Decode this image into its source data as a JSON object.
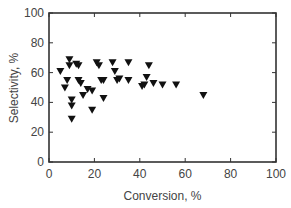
{
  "chart_data": {
    "type": "scatter",
    "title": "",
    "xlabel": "Conversion, %",
    "ylabel": "Selectivity, %",
    "xlim": [
      0,
      100
    ],
    "ylim": [
      0,
      100
    ],
    "xticks": [
      0,
      20,
      40,
      60,
      80,
      100
    ],
    "yticks": [
      0,
      20,
      40,
      60,
      80,
      100
    ],
    "grid": false,
    "legend": null,
    "marker": "down-triangle",
    "marker_color": "#111111",
    "series": [
      {
        "name": "data",
        "points": [
          [
            5,
            61
          ],
          [
            7,
            50
          ],
          [
            8,
            55
          ],
          [
            9,
            69
          ],
          [
            9,
            65
          ],
          [
            10,
            42
          ],
          [
            10,
            38
          ],
          [
            10,
            29
          ],
          [
            12,
            66
          ],
          [
            13,
            65
          ],
          [
            13,
            55
          ],
          [
            14,
            53
          ],
          [
            15,
            45
          ],
          [
            17,
            49
          ],
          [
            19,
            48
          ],
          [
            19,
            35
          ],
          [
            21,
            67
          ],
          [
            22,
            65
          ],
          [
            23,
            55
          ],
          [
            24,
            55
          ],
          [
            24,
            43
          ],
          [
            28,
            67
          ],
          [
            29,
            61
          ],
          [
            30,
            55
          ],
          [
            31,
            56
          ],
          [
            35,
            67
          ],
          [
            35,
            55
          ],
          [
            41,
            51
          ],
          [
            42,
            52
          ],
          [
            43,
            57
          ],
          [
            44,
            65
          ],
          [
            46,
            53
          ],
          [
            50,
            52
          ],
          [
            56,
            52
          ],
          [
            68,
            45
          ]
        ]
      }
    ]
  }
}
